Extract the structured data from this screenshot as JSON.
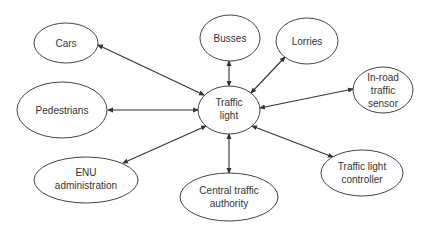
{
  "diagram": {
    "type": "context-diagram",
    "colors": {
      "stroke": "#444444",
      "text": "#333333",
      "background": "#ffffff"
    },
    "center": {
      "id": "traffic_light",
      "lines": [
        "Traffic",
        "light"
      ]
    },
    "nodes": [
      {
        "id": "cars",
        "lines": [
          "Cars"
        ]
      },
      {
        "id": "busses",
        "lines": [
          "Busses"
        ]
      },
      {
        "id": "lorries",
        "lines": [
          "Lorries"
        ]
      },
      {
        "id": "in_road_sensor",
        "lines": [
          "In-road",
          "traffic",
          "sensor"
        ]
      },
      {
        "id": "pedestrians",
        "lines": [
          "Pedestrians"
        ]
      },
      {
        "id": "enu",
        "lines": [
          "ENU",
          "administration"
        ]
      },
      {
        "id": "central_authority",
        "lines": [
          "Central traffic",
          "authority"
        ]
      },
      {
        "id": "controller",
        "lines": [
          "Traffic light",
          "controller"
        ]
      }
    ],
    "edges": [
      {
        "from": "traffic_light",
        "to": "cars",
        "bidirectional": true
      },
      {
        "from": "traffic_light",
        "to": "busses",
        "bidirectional": true
      },
      {
        "from": "traffic_light",
        "to": "lorries",
        "bidirectional": true
      },
      {
        "from": "traffic_light",
        "to": "in_road_sensor",
        "bidirectional": true
      },
      {
        "from": "traffic_light",
        "to": "pedestrians",
        "bidirectional": true
      },
      {
        "from": "traffic_light",
        "to": "enu",
        "bidirectional": true
      },
      {
        "from": "traffic_light",
        "to": "central_authority",
        "bidirectional": true
      },
      {
        "from": "traffic_light",
        "to": "controller",
        "bidirectional": true
      }
    ]
  }
}
